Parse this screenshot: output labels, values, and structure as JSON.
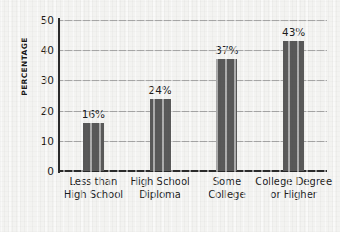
{
  "chart_data": {
    "type": "bar",
    "title": "",
    "subtitle": "",
    "xlabel": "",
    "ylabel": "PERCENTAGE",
    "categories": [
      "Less than High School",
      "High School Diploma",
      "Some College",
      "College Degree or Higher"
    ],
    "category_lines": [
      [
        "Less than",
        "High School"
      ],
      [
        "High School",
        "Diploma"
      ],
      [
        "Some",
        "College"
      ],
      [
        "College Degree",
        "or Higher"
      ]
    ],
    "values": [
      16,
      24,
      37,
      43
    ],
    "value_labels": [
      "16%",
      "24%",
      "37%",
      "43%"
    ],
    "ylim": [
      0,
      50
    ],
    "ytick_values": [
      50,
      40,
      30,
      20,
      10,
      0
    ],
    "ytick_labels": [
      "50",
      "40",
      "30",
      "20",
      "10",
      "0"
    ],
    "grid": true,
    "grid_axis": "y",
    "legend": false,
    "legend_position": "none",
    "bar_color": "#595959",
    "axis_color": "#2b2b2b",
    "grid_color": "#8d8d8d",
    "background_color": "#f3f3f1",
    "text_color": "#1d1d1d"
  }
}
